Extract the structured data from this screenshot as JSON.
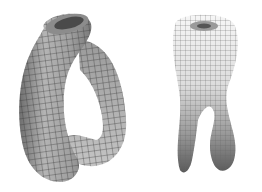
{
  "figures": [
    {
      "id": "klein-bottle-side-view",
      "shading": "#a8a8a8",
      "grid": "#3a3a3a"
    },
    {
      "id": "klein-bottle-front-view",
      "shading_top": "#f4f4f4",
      "shading_bottom": "#6a6a6a",
      "grid": "#555555"
    }
  ],
  "colors": {
    "background": "#ffffff"
  }
}
